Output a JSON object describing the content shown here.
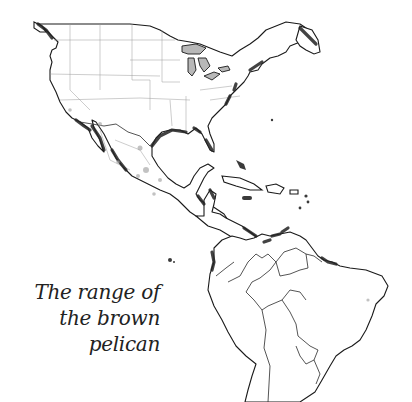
{
  "map": {
    "title": "The range of the brown pelican",
    "caption_lines": [
      "The range of",
      "the brown",
      "pelican"
    ],
    "region": "North, Central and South America",
    "colors": {
      "land": "#ffffff",
      "coastline": "#1a1a1a",
      "range_highlight": "#222222",
      "lakes": "#b8b8b8",
      "inland_range": "#a8a8a8",
      "background": "#ffffff"
    }
  }
}
